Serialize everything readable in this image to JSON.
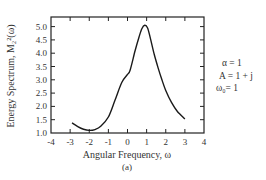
{
  "chart_data": {
    "type": "line",
    "title": "",
    "caption": "(a)",
    "xlabel": "Angular Frequency, ω",
    "ylabel": "Energy Spectrum, M₂²(ω)",
    "xlim": [
      -4,
      4
    ],
    "ylim": [
      1.0,
      5.4
    ],
    "xticks": [
      -4,
      -3,
      -2,
      -1,
      0,
      1,
      2,
      3,
      4
    ],
    "xtick_labels": [
      "-4",
      "-3",
      "-2",
      "-1",
      "0",
      "1",
      "2",
      "3",
      "4"
    ],
    "yticks": [
      1.0,
      1.5,
      2.0,
      2.5,
      3.0,
      3.5,
      4.0,
      4.5,
      5.0
    ],
    "ytick_labels": [
      "1.0",
      "1.5",
      "2.0",
      "2.5",
      "3.0",
      "3.5",
      "4.0",
      "4.5",
      "5.0"
    ],
    "grid": false,
    "series": [
      {
        "name": "M2^2(ω)",
        "x": [
          -2.9,
          -2.6,
          -2.3,
          -2.0,
          -1.7,
          -1.4,
          -1.0,
          -0.65,
          -0.3,
          0.0,
          0.14,
          0.4,
          0.6,
          0.75,
          0.9,
          1.05,
          1.2,
          1.4,
          1.6,
          1.8,
          2.0,
          2.3,
          2.6,
          3.0
        ],
        "values": [
          1.38,
          1.24,
          1.14,
          1.1,
          1.13,
          1.25,
          1.6,
          2.24,
          2.9,
          3.2,
          3.37,
          4.1,
          4.6,
          4.92,
          5.05,
          4.95,
          4.55,
          3.95,
          3.45,
          3.0,
          2.6,
          2.15,
          1.82,
          1.53
        ]
      }
    ],
    "annotations": [
      "α = 1",
      "A = 1 + j",
      "ω₀= 1"
    ]
  },
  "labels": {
    "xlabel": "Angular Frequency, ω",
    "ylabel": "Energy Spectrum, M₂²(ω)",
    "caption": "(a)",
    "annot_alpha": "α = 1",
    "annot_A": "A = 1 + j",
    "annot_omega": "ω₀= 1"
  }
}
